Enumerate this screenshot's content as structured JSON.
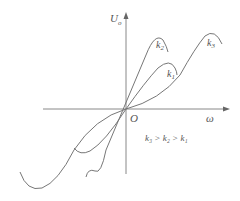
{
  "axes": {
    "y_label": "U",
    "y_label_sub": "o",
    "x_label": "ω",
    "origin_label": "O"
  },
  "curves": [
    {
      "name": "k1",
      "label": "k",
      "sub": "1"
    },
    {
      "name": "k2",
      "label": "k",
      "sub": "2"
    },
    {
      "name": "k3",
      "label": "k",
      "sub": "3"
    }
  ],
  "relation": {
    "text": "k₃ > k₂ > k₁"
  },
  "colors": {
    "line": "#777777",
    "text": "#555555"
  }
}
